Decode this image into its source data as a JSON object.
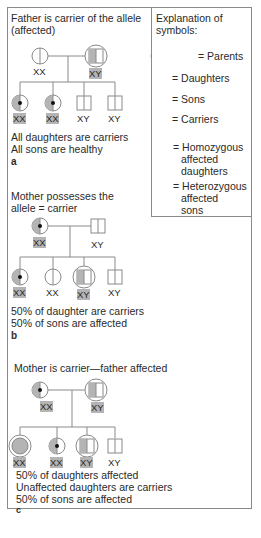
{
  "legend": {
    "title": "Explanation of symbols:",
    "title_line1": "Explanation of",
    "title_line2": "symbols:",
    "items": [
      {
        "symbol": "parents-icon",
        "label": "= Parents"
      },
      {
        "symbol": "daughter-icon",
        "label": "= Daughters"
      },
      {
        "symbol": "son-icon",
        "label": "= Sons"
      },
      {
        "symbol": "carrier-icon",
        "label": "= Carriers"
      },
      {
        "symbol": "homozygous-affected-daughter-icon",
        "label_lines": [
          "= Homozygous",
          "affected",
          "daughters"
        ]
      },
      {
        "symbol": "heterozygous-affected-son-icon",
        "label_lines": [
          "= Heterozygous",
          "affected",
          "sons"
        ]
      }
    ]
  },
  "panels": [
    {
      "letter": "a",
      "title_lines": [
        "Father is carrier of the allele",
        "(affected)"
      ],
      "parents": [
        {
          "type": "daughter",
          "genotype": "XX"
        },
        {
          "type": "affected-son",
          "genotype": "XY"
        }
      ],
      "children": [
        {
          "type": "carrier",
          "genotype": "XX"
        },
        {
          "type": "carrier",
          "genotype": "XX"
        },
        {
          "type": "son",
          "genotype": "XY"
        },
        {
          "type": "son",
          "genotype": "XY"
        }
      ],
      "summary_lines": [
        "All daughters are carriers",
        "All sons are healthy"
      ]
    },
    {
      "letter": "b",
      "title_lines": [
        "Mother possesses the",
        "allele = carrier"
      ],
      "parents": [
        {
          "type": "carrier",
          "genotype": "XX"
        },
        {
          "type": "son",
          "genotype": "XY"
        }
      ],
      "children": [
        {
          "type": "carrier",
          "genotype": "XX"
        },
        {
          "type": "daughter",
          "genotype": "XX"
        },
        {
          "type": "affected-son",
          "genotype": "XY"
        },
        {
          "type": "son",
          "genotype": "XY"
        }
      ],
      "summary_lines": [
        "50% of daughter are carriers",
        "50% of sons are affected"
      ]
    },
    {
      "letter": "c",
      "title_lines": [
        "Mother is carrier—father affected"
      ],
      "parents": [
        {
          "type": "carrier",
          "genotype": "XX"
        },
        {
          "type": "affected-son",
          "genotype": "XY"
        }
      ],
      "children": [
        {
          "type": "affected-daughter",
          "genotype": "XX"
        },
        {
          "type": "carrier",
          "genotype": "XX"
        },
        {
          "type": "affected-son",
          "genotype": "XY"
        },
        {
          "type": "son",
          "genotype": "XY"
        }
      ],
      "summary_lines": [
        "50% of daughters affected",
        "Unaffected daughters are carriers",
        "50% of sons are affected"
      ]
    }
  ],
  "colors": {
    "line": "#8a8a8a",
    "fill": "#b4b4b4",
    "dot": "#111111",
    "text": "#2a2a2a"
  }
}
